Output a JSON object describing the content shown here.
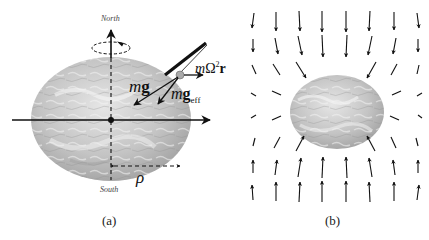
{
  "figure": {
    "panel_a": {
      "caption": "(a)",
      "north_label": "North",
      "south_label": "South",
      "rho_label": "ρ",
      "vectors": {
        "mg": {
          "m": "m",
          "g": "g"
        },
        "mg_eff": {
          "m": "m",
          "g": "g",
          "sub": "eff"
        },
        "centrifugal": {
          "m": "m",
          "omega": "Ω",
          "exp": "2",
          "r": "r"
        }
      }
    },
    "panel_b": {
      "caption": "(b)",
      "description": "Gravitational vector field pointing toward an oblate Earth"
    },
    "colors": {
      "earth_light": "#d8d8d8",
      "earth_dark": "#a8a8a8",
      "arrow": "#111111",
      "label": "#444444"
    }
  }
}
